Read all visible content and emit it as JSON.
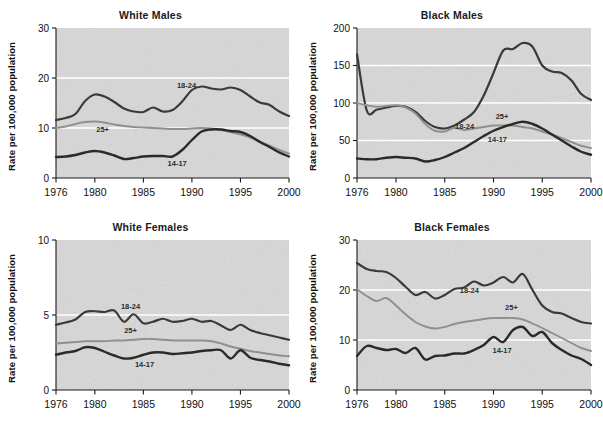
{
  "figure": {
    "ylabel": "Rate per 100,000 population",
    "xlabel": "",
    "xticks": [
      "1976",
      "1980",
      "1985",
      "1990",
      "1995",
      "2000"
    ],
    "xtick_values": [
      1976,
      1980,
      1985,
      1990,
      1995,
      2000
    ],
    "series_labels": {
      "a": "18-24",
      "b": "25+",
      "c": "14-17"
    },
    "colors": {
      "line_1824": "#3a3a3a",
      "line_25plus": "#8f8f8f",
      "line_1417": "#2a2a2a",
      "plot_bg": "#d9d9d9",
      "axis": "#1a1a1a",
      "gridline": "#ffffff"
    }
  },
  "chart_data": [
    {
      "type": "line",
      "title": "White Males",
      "xlabel": "",
      "ylabel": "Rate per 100,000 population",
      "xlim": [
        1976,
        2000
      ],
      "ylim": [
        0,
        30
      ],
      "yticks": [
        0,
        10,
        20,
        30
      ],
      "xticks": [
        1976,
        1980,
        1985,
        1990,
        1995,
        2000
      ],
      "grid": "horizontal-white",
      "legend": "inline-labels",
      "x": [
        1976,
        1977,
        1978,
        1979,
        1980,
        1981,
        1982,
        1983,
        1984,
        1985,
        1986,
        1987,
        1988,
        1989,
        1990,
        1991,
        1992,
        1993,
        1994,
        1995,
        1996,
        1997,
        1998,
        1999,
        2000
      ],
      "series": [
        {
          "name": "18-24",
          "values": [
            11.6,
            12.0,
            12.8,
            15.4,
            16.7,
            16.3,
            15.2,
            13.9,
            13.3,
            13.2,
            14.1,
            13.3,
            13.6,
            15.3,
            17.6,
            18.3,
            17.9,
            17.7,
            18.1,
            17.6,
            16.3,
            15.1,
            14.6,
            13.3,
            12.4
          ]
        },
        {
          "name": "25+",
          "values": [
            10.0,
            10.3,
            10.8,
            11.2,
            11.3,
            11.1,
            10.7,
            10.4,
            10.2,
            10.1,
            10.0,
            9.9,
            9.8,
            9.8,
            9.9,
            10.0,
            9.9,
            9.6,
            9.2,
            8.7,
            8.1,
            7.3,
            6.5,
            5.6,
            4.9
          ]
        },
        {
          "name": "14-17",
          "values": [
            4.2,
            4.3,
            4.6,
            5.1,
            5.4,
            5.1,
            4.5,
            3.8,
            4.0,
            4.3,
            4.4,
            4.4,
            4.3,
            5.6,
            7.6,
            9.3,
            9.7,
            9.7,
            9.4,
            9.2,
            8.4,
            7.2,
            6.2,
            5.1,
            4.3
          ]
        }
      ]
    },
    {
      "type": "line",
      "title": "Black Males",
      "xlabel": "",
      "ylabel": "Rate per 100,000 population",
      "xlim": [
        1976,
        2000
      ],
      "ylim": [
        0,
        200
      ],
      "yticks": [
        0,
        50,
        100,
        150,
        200
      ],
      "xticks": [
        1976,
        1980,
        1985,
        1990,
        1995,
        2000
      ],
      "grid": "horizontal-white",
      "legend": "inline-labels",
      "x": [
        1976,
        1977,
        1978,
        1979,
        1980,
        1981,
        1982,
        1983,
        1984,
        1985,
        1986,
        1987,
        1988,
        1989,
        1990,
        1991,
        1992,
        1993,
        1994,
        1995,
        1996,
        1997,
        1998,
        1999,
        2000
      ],
      "series": [
        {
          "name": "18-24",
          "values": [
            165,
            90,
            91,
            94,
            96,
            95,
            88,
            76,
            68,
            66,
            70,
            78,
            88,
            110,
            140,
            170,
            172,
            180,
            175,
            150,
            142,
            140,
            130,
            112,
            104
          ]
        },
        {
          "name": "25+",
          "values": [
            100,
            97,
            95,
            96,
            97,
            94,
            86,
            72,
            63,
            62,
            67,
            64,
            66,
            68,
            70,
            70,
            70,
            68,
            66,
            62,
            58,
            53,
            48,
            43,
            40
          ]
        },
        {
          "name": "14-17",
          "values": [
            26,
            25,
            25,
            27,
            28,
            27,
            26,
            22,
            24,
            28,
            34,
            40,
            48,
            56,
            63,
            68,
            72,
            75,
            72,
            66,
            58,
            50,
            42,
            35,
            31
          ]
        }
      ]
    },
    {
      "type": "line",
      "title": "White Females",
      "xlabel": "",
      "ylabel": "Rate per 100,000 population",
      "xlim": [
        1976,
        2000
      ],
      "ylim": [
        0,
        10
      ],
      "yticks": [
        0,
        5,
        10
      ],
      "xticks": [
        1976,
        1980,
        1985,
        1990,
        1995,
        2000
      ],
      "grid": "horizontal-white",
      "legend": "inline-labels",
      "x": [
        1976,
        1977,
        1978,
        1979,
        1980,
        1981,
        1982,
        1983,
        1984,
        1985,
        1986,
        1987,
        1988,
        1989,
        1990,
        1991,
        1992,
        1993,
        1994,
        1995,
        1996,
        1997,
        1998,
        1999,
        2000
      ],
      "series": [
        {
          "name": "18-24",
          "values": [
            4.35,
            4.5,
            4.7,
            5.2,
            5.25,
            5.2,
            5.3,
            4.55,
            5.05,
            4.45,
            4.55,
            4.75,
            4.55,
            4.6,
            4.75,
            4.55,
            4.6,
            4.3,
            4.0,
            4.35,
            4.0,
            3.8,
            3.65,
            3.5,
            3.35
          ]
        },
        {
          "name": "25+",
          "values": [
            3.1,
            3.15,
            3.2,
            3.25,
            3.25,
            3.25,
            3.3,
            3.3,
            3.35,
            3.4,
            3.4,
            3.35,
            3.3,
            3.3,
            3.3,
            3.3,
            3.25,
            3.1,
            2.9,
            2.75,
            2.6,
            2.5,
            2.4,
            2.3,
            2.25
          ]
        },
        {
          "name": "14-17",
          "values": [
            2.35,
            2.5,
            2.6,
            2.85,
            2.8,
            2.55,
            2.3,
            2.1,
            2.15,
            2.35,
            2.5,
            2.5,
            2.4,
            2.45,
            2.5,
            2.6,
            2.65,
            2.65,
            2.1,
            2.65,
            2.15,
            2.0,
            1.9,
            1.75,
            1.65
          ]
        }
      ]
    },
    {
      "type": "line",
      "title": "Black Females",
      "xlabel": "",
      "ylabel": "Rate per 100,000 population",
      "xlim": [
        1976,
        2000
      ],
      "ylim": [
        0,
        30
      ],
      "yticks": [
        0,
        10,
        20,
        30
      ],
      "xticks": [
        1976,
        1980,
        1985,
        1990,
        1995,
        2000
      ],
      "grid": "horizontal-white",
      "legend": "inline-labels",
      "x": [
        1976,
        1977,
        1978,
        1979,
        1980,
        1981,
        1982,
        1983,
        1984,
        1985,
        1986,
        1987,
        1988,
        1989,
        1990,
        1991,
        1992,
        1993,
        1994,
        1995,
        1996,
        1997,
        1998,
        1999,
        2000
      ],
      "series": [
        {
          "name": "18-24",
          "values": [
            25.4,
            24.2,
            23.8,
            23.6,
            22.4,
            20.6,
            19.0,
            19.6,
            18.3,
            19.0,
            20.2,
            20.5,
            21.7,
            20.9,
            21.5,
            22.6,
            21.5,
            23.2,
            20.0,
            16.9,
            15.6,
            15.3,
            14.4,
            13.6,
            13.3
          ]
        },
        {
          "name": "25+",
          "values": [
            20.2,
            18.8,
            17.8,
            18.4,
            16.9,
            15.1,
            13.6,
            12.7,
            12.3,
            12.6,
            13.2,
            13.6,
            13.9,
            14.2,
            14.4,
            14.4,
            14.4,
            14.1,
            13.3,
            12.4,
            11.4,
            10.4,
            9.4,
            8.4,
            7.8
          ]
        },
        {
          "name": "14-17",
          "values": [
            6.8,
            8.8,
            8.4,
            8.0,
            8.2,
            7.4,
            8.4,
            6.1,
            6.8,
            6.9,
            7.3,
            7.3,
            8.0,
            9.0,
            10.6,
            9.6,
            12.0,
            12.6,
            10.8,
            11.6,
            9.4,
            8.0,
            6.9,
            6.2,
            5.0
          ]
        }
      ]
    }
  ]
}
